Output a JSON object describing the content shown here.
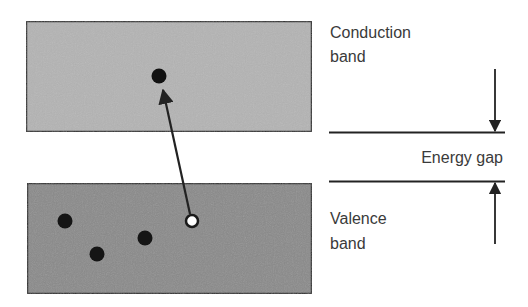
{
  "diagram": {
    "colors": {
      "conduction_fill": "#b4b4b4",
      "valence_fill": "#8a8a8a",
      "border": "#2e2e2e",
      "electron": "#111111",
      "hole": "#ffffff",
      "line": "#222222",
      "text": "#3a3a3a"
    },
    "conduction_band": {
      "label_line1": "Conduction",
      "label_line2": "band",
      "electrons": 1
    },
    "valence_band": {
      "label_line1": "Valence",
      "label_line2": "band",
      "electrons": 3,
      "holes": 1
    },
    "energy_gap": {
      "label": "Energy gap"
    },
    "excitation_arrow": {
      "from": "hole (valence band)",
      "to": "electron (conduction band)"
    }
  }
}
